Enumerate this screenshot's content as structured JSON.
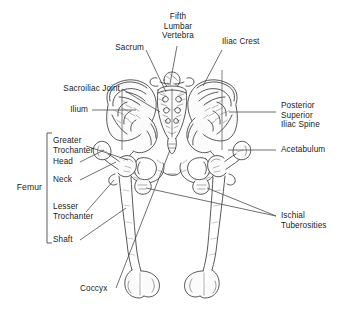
{
  "figure": {
    "view": "posterior",
    "background_color": "#ffffff",
    "line_color": "#3a3a3a",
    "text_color": "#222222"
  },
  "labels": {
    "fifth_lumbar_vertebra": "Fifth\nLumbar\nVertebra",
    "sacrum": "Sacrum",
    "iliac_crest": "Iliac Crest",
    "sacroiliac_joint": "Sacroiliac Joint",
    "ilium": "Ilium",
    "posterior_superior_iliac_spine": "Posterior\nSuperior\nIliac Spine",
    "acetabulum": "Acetabulum",
    "ischial_tuberosities": "Ischial\nTuberosities",
    "coccyx": "Coccyx",
    "femur_group": "Femur",
    "greater_trochanter": "Greater\nTrochanter",
    "head": "Head",
    "neck": "Neck",
    "lesser_trochanter": "Lesser\nTrochanter",
    "shaft": "Shaft"
  }
}
